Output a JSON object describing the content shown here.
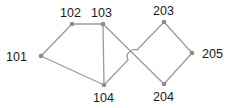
{
  "diagram": {
    "type": "graph",
    "colors": {
      "edge": "#9a9a9a",
      "node": "#8c8c8c",
      "label": "#1a1a1a",
      "background": "#ffffff"
    },
    "nodes": [
      {
        "id": "101",
        "label": "101",
        "x": 41,
        "y": 56,
        "label_x": 6,
        "label_y": 61
      },
      {
        "id": "102",
        "label": "102",
        "x": 72,
        "y": 24,
        "label_x": 60,
        "label_y": 17
      },
      {
        "id": "103",
        "label": "103",
        "x": 103,
        "y": 24,
        "label_x": 91,
        "label_y": 17
      },
      {
        "id": "104",
        "label": "104",
        "x": 104,
        "y": 85,
        "label_x": 93,
        "label_y": 102
      },
      {
        "id": "203",
        "label": "203",
        "x": 164,
        "y": 22,
        "label_x": 153,
        "label_y": 15
      },
      {
        "id": "205",
        "label": "205",
        "x": 192,
        "y": 53,
        "label_x": 202,
        "label_y": 58
      },
      {
        "id": "204",
        "label": "204",
        "x": 164,
        "y": 84,
        "label_x": 153,
        "label_y": 101
      }
    ],
    "edges": [
      {
        "from": "101",
        "to": "102"
      },
      {
        "from": "102",
        "to": "103"
      },
      {
        "from": "101",
        "to": "104"
      },
      {
        "from": "103",
        "to": "104"
      },
      {
        "from": "103",
        "to": "204"
      },
      {
        "from": "104",
        "to": "203",
        "hop": true
      },
      {
        "from": "203",
        "to": "205"
      },
      {
        "from": "205",
        "to": "204"
      }
    ]
  }
}
